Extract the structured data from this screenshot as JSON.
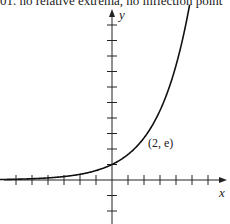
{
  "caption": "01. no relative extrema, no inflection point",
  "chart_data": {
    "type": "line",
    "title": "",
    "function": "y = e^(x/2)",
    "xlabel": "x",
    "ylabel": "y",
    "xlim": [
      -7,
      7
    ],
    "ylim": [
      -2.5,
      11
    ],
    "x_ticks": [
      -6,
      -5,
      -4,
      -3,
      -2,
      -1,
      1,
      2,
      3,
      4,
      5,
      6
    ],
    "y_ticks": [
      -2,
      -1,
      1,
      2,
      3,
      4,
      5,
      6,
      7,
      8,
      9,
      10
    ],
    "tick_labels_shown": false,
    "grid": false,
    "series": [
      {
        "name": "f(x) = e^(x/2)",
        "x": [
          -7,
          -6,
          -5,
          -4,
          -3,
          -2,
          -1,
          0,
          1,
          2,
          3,
          4,
          4.8
        ],
        "y": [
          0.03,
          0.05,
          0.08,
          0.14,
          0.22,
          0.37,
          0.61,
          1,
          1.65,
          2.72,
          4.48,
          7.39,
          11.02
        ]
      }
    ],
    "annotations": [
      {
        "text": "(2, e)",
        "x": 2,
        "y": 2.718
      }
    ]
  },
  "axes": {
    "x_label": "x",
    "y_label": "y"
  },
  "point_label": "(2, e)"
}
